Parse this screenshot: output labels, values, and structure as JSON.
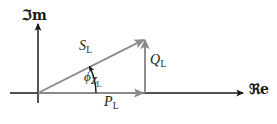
{
  "figure": {
    "kind": "phasor-power-triangle",
    "background_color": "#ffffff",
    "axis_color": "#1a1a1a",
    "vector_color": "#808080",
    "arc_color": "#1a1a1a",
    "width": 277,
    "height": 124
  },
  "axes": {
    "imaginary": {
      "label": "ℑm",
      "label_plain": "Im",
      "orientation": "vertical",
      "origin_x": 38,
      "top_y": 22,
      "bottom_y": 103,
      "arrow_at": "top"
    },
    "real": {
      "label": "ℜe",
      "label_plain": "Re",
      "orientation": "horizontal",
      "origin_y": 93,
      "left_x": 10,
      "right_x": 245,
      "arrow_at": "right"
    }
  },
  "vectors": [
    {
      "id": "apparent-power",
      "symbol": "S",
      "subscript": "L",
      "label": "S_L",
      "description": "apparent power phasor (hypotenuse)",
      "from": {
        "x": 38,
        "y": 93
      },
      "to": {
        "x": 145,
        "y": 38
      },
      "color": "#808080",
      "arrow": true
    },
    {
      "id": "real-power",
      "symbol": "P",
      "subscript": "L",
      "label": "P_L",
      "description": "real (active) power along the real axis",
      "from": {
        "x": 38,
        "y": 93
      },
      "to": {
        "x": 145,
        "y": 93
      },
      "color": "#808080",
      "arrow": true
    },
    {
      "id": "reactive-power",
      "symbol": "Q",
      "subscript": "L",
      "label": "Q_L",
      "description": "reactive power parallel to the imaginary axis",
      "from": {
        "x": 145,
        "y": 93
      },
      "to": {
        "x": 145,
        "y": 38
      },
      "color": "#808080",
      "arrow": true
    }
  ],
  "angle": {
    "id": "impedance-angle",
    "symbol": "ϕ",
    "subscript": "Z",
    "sub_subscript": "L",
    "label": "phi_Z_L",
    "description": "impedance phase angle between P_L and S_L",
    "vertex": {
      "x": 38,
      "y": 93
    },
    "start_deg": 0,
    "end_deg": 27,
    "arc_radius": 58,
    "arrow_at": "end",
    "color": "#1a1a1a"
  },
  "labels": {
    "imaginary_axis": "ℑm",
    "real_axis": "ℜe",
    "apparent_power": "S",
    "apparent_power_sub": "L",
    "reactive_power": "Q",
    "reactive_power_sub": "L",
    "real_power": "P",
    "real_power_sub": "L",
    "angle": "ϕ",
    "angle_sub": "Z",
    "angle_sub_sub": "L"
  }
}
